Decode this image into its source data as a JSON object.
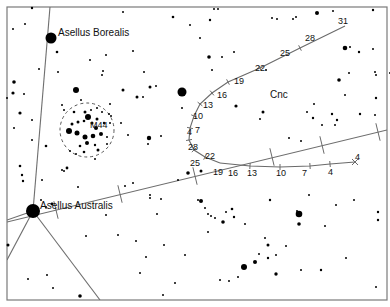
{
  "chart": {
    "frame": {
      "x": 7,
      "y": 7,
      "w": 380,
      "h": 293
    },
    "constellation_label": {
      "text": "Cnc",
      "x": 270,
      "y": 98
    },
    "named_stars": [
      {
        "name": "Asellus Borealis",
        "x": 51,
        "y": 38,
        "r": 5.5,
        "label_x": 58,
        "label_y": 36
      },
      {
        "name": "Asellus Australis",
        "x": 33,
        "y": 211,
        "r": 7,
        "label_x": 40,
        "label_y": 209
      }
    ],
    "cluster": {
      "label": "M44",
      "cx": 87,
      "cy": 130,
      "r": 27,
      "label_x": 90,
      "label_y": 128
    },
    "constellation_lines": [
      [
        [
          50,
          7
        ],
        [
          33,
          211
        ]
      ],
      [
        [
          33,
          211
        ],
        [
          7,
          260
        ]
      ],
      [
        [
          33,
          211
        ],
        [
          100,
          300
        ]
      ],
      [
        [
          33,
          211
        ],
        [
          7,
          220
        ]
      ]
    ],
    "ecliptic": {
      "points": [
        [
          7,
          222
        ],
        [
          387,
          130
        ]
      ],
      "ticks": [
        [
          56,
          210
        ],
        [
          120,
          194
        ],
        [
          195,
          176
        ],
        [
          272,
          157
        ],
        [
          322,
          145
        ],
        [
          378,
          132
        ]
      ]
    },
    "path_upper": {
      "points": [
        [
          345,
          26
        ],
        [
          300,
          48
        ],
        [
          260,
          68
        ],
        [
          228,
          82
        ],
        [
          212,
          93
        ],
        [
          200,
          104
        ],
        [
          194,
          116
        ],
        [
          190,
          128
        ],
        [
          189,
          140
        ],
        [
          194,
          150
        ],
        [
          205,
          157
        ],
        [
          220,
          163
        ]
      ],
      "labels": [
        {
          "t": "31",
          "x": 338,
          "y": 24
        },
        {
          "t": "28",
          "x": 305,
          "y": 41
        },
        {
          "t": "25",
          "x": 280,
          "y": 56
        },
        {
          "t": "22",
          "x": 255,
          "y": 71
        },
        {
          "t": "19",
          "x": 234,
          "y": 84
        },
        {
          "t": "16",
          "x": 217,
          "y": 98
        },
        {
          "t": "13",
          "x": 203,
          "y": 108
        },
        {
          "t": "10",
          "x": 193,
          "y": 119
        },
        {
          "t": "7",
          "x": 195,
          "y": 133
        },
        {
          "t": "4",
          "x": 187,
          "y": 135
        },
        {
          "t": "28",
          "x": 188,
          "y": 150
        },
        {
          "t": "22",
          "x": 205,
          "y": 159
        },
        {
          "t": "25",
          "x": 190,
          "y": 166
        }
      ]
    },
    "path_lower": {
      "points": [
        [
          220,
          163
        ],
        [
          250,
          166
        ],
        [
          280,
          167
        ],
        [
          310,
          166
        ],
        [
          330,
          164
        ],
        [
          355,
          162
        ]
      ],
      "end_marker": {
        "x": 355,
        "y": 162
      },
      "labels": [
        {
          "t": "19",
          "x": 213,
          "y": 175
        },
        {
          "t": "16",
          "x": 228,
          "y": 176
        },
        {
          "t": "13",
          "x": 247,
          "y": 176
        },
        {
          "t": "10",
          "x": 276,
          "y": 176
        },
        {
          "t": "7",
          "x": 302,
          "y": 176
        },
        {
          "t": "4",
          "x": 328,
          "y": 175
        },
        {
          "t": "4",
          "x": 355,
          "y": 160
        }
      ]
    },
    "stars": [
      [
        32,
        8,
        1.2
      ],
      [
        13,
        29,
        1
      ],
      [
        25,
        24,
        1
      ],
      [
        123,
        12,
        1
      ],
      [
        173,
        17,
        1.3
      ],
      [
        190,
        25,
        1
      ],
      [
        210,
        20,
        1.2
      ],
      [
        214,
        9,
        1
      ],
      [
        218,
        9,
        1
      ],
      [
        272,
        18,
        1
      ],
      [
        277,
        19,
        1
      ],
      [
        293,
        19,
        1
      ],
      [
        296,
        17,
        1
      ],
      [
        317,
        13,
        2
      ],
      [
        333,
        11,
        1
      ],
      [
        373,
        10,
        1.2
      ],
      [
        39,
        69,
        1
      ],
      [
        57,
        52,
        1.3
      ],
      [
        90,
        60,
        1
      ],
      [
        106,
        55,
        1
      ],
      [
        133,
        51,
        1
      ],
      [
        103,
        71,
        1
      ],
      [
        58,
        72,
        1
      ],
      [
        102,
        75,
        1
      ],
      [
        144,
        72,
        1
      ],
      [
        150,
        87,
        1.5
      ],
      [
        156,
        86,
        1
      ],
      [
        14,
        82,
        1.8
      ],
      [
        13,
        93,
        1.6
      ],
      [
        24,
        94,
        1
      ],
      [
        7,
        98,
        1
      ],
      [
        20,
        113,
        1.6
      ],
      [
        32,
        120,
        1
      ],
      [
        14,
        128,
        1
      ],
      [
        32,
        140,
        1
      ],
      [
        62,
        105,
        1
      ],
      [
        81,
        100,
        1
      ],
      [
        76,
        90,
        3
      ],
      [
        123,
        90,
        1.5
      ],
      [
        137,
        97,
        1.5
      ],
      [
        143,
        97,
        1
      ],
      [
        182,
        92,
        4.5
      ],
      [
        182,
        108,
        1
      ],
      [
        110,
        104,
        1
      ],
      [
        111,
        116,
        1
      ],
      [
        121,
        123,
        1
      ],
      [
        128,
        135,
        1
      ],
      [
        149,
        138,
        2.2
      ],
      [
        161,
        136,
        1
      ],
      [
        148,
        144,
        1
      ],
      [
        222,
        57,
        1
      ],
      [
        209,
        57,
        1.8
      ],
      [
        200,
        38,
        1
      ],
      [
        234,
        52,
        1
      ],
      [
        266,
        70,
        1
      ],
      [
        212,
        70,
        1
      ],
      [
        236,
        106,
        1.6
      ],
      [
        263,
        112,
        1.5
      ],
      [
        260,
        119,
        1
      ],
      [
        313,
        118,
        1.2
      ],
      [
        322,
        125,
        1
      ],
      [
        337,
        120,
        1.2
      ],
      [
        289,
        138,
        1
      ],
      [
        301,
        141,
        1
      ],
      [
        314,
        104,
        1
      ],
      [
        307,
        112,
        1
      ],
      [
        332,
        114,
        1.2
      ],
      [
        360,
        114,
        1.2
      ],
      [
        375,
        115,
        1
      ],
      [
        376,
        98,
        1.2
      ],
      [
        375,
        72,
        1
      ],
      [
        390,
        73,
        1
      ],
      [
        359,
        52,
        1.2
      ],
      [
        345,
        48,
        2.3
      ],
      [
        350,
        47,
        1
      ],
      [
        373,
        49,
        1
      ],
      [
        376,
        75,
        1
      ],
      [
        349,
        73,
        1
      ],
      [
        339,
        80,
        1.8
      ],
      [
        345,
        95,
        1
      ],
      [
        335,
        125,
        1
      ],
      [
        20,
        166,
        1.3
      ],
      [
        22,
        175,
        1.2
      ],
      [
        46,
        146,
        1.3
      ],
      [
        62,
        170,
        1
      ],
      [
        95,
        159,
        1
      ],
      [
        64,
        171,
        1
      ],
      [
        67,
        168,
        1.4
      ],
      [
        23,
        181,
        1.2
      ],
      [
        42,
        180,
        1
      ],
      [
        46,
        207,
        1
      ],
      [
        52,
        204,
        1.4
      ],
      [
        78,
        187,
        1
      ],
      [
        41,
        200,
        1
      ],
      [
        125,
        186,
        1
      ],
      [
        133,
        183,
        1
      ],
      [
        150,
        195,
        1
      ],
      [
        150,
        198,
        1
      ],
      [
        161,
        199,
        1
      ],
      [
        178,
        180,
        1
      ],
      [
        188,
        173,
        1.8
      ],
      [
        201,
        171,
        1.5
      ],
      [
        157,
        214,
        1
      ],
      [
        106,
        215,
        1
      ],
      [
        198,
        200,
        1
      ],
      [
        208,
        214,
        1
      ],
      [
        215,
        218,
        1
      ],
      [
        211,
        216,
        1
      ],
      [
        226,
        212,
        1
      ],
      [
        118,
        235,
        1
      ],
      [
        136,
        241,
        1
      ],
      [
        146,
        257,
        1
      ],
      [
        140,
        273,
        1
      ],
      [
        185,
        255,
        1
      ],
      [
        86,
        236,
        1
      ],
      [
        28,
        279,
        1
      ],
      [
        47,
        275,
        1
      ],
      [
        53,
        288,
        1
      ],
      [
        80,
        296,
        1.8
      ],
      [
        8,
        245,
        1.5
      ],
      [
        164,
        245,
        1
      ],
      [
        163,
        295,
        1
      ],
      [
        201,
        201,
        2
      ],
      [
        205,
        208,
        1
      ],
      [
        223,
        222,
        1.8
      ],
      [
        234,
        217,
        1.2
      ],
      [
        270,
        200,
        1.2
      ],
      [
        232,
        209,
        1.3
      ],
      [
        208,
        232,
        1
      ],
      [
        245,
        224,
        1
      ],
      [
        265,
        238,
        1
      ],
      [
        268,
        245,
        1.5
      ],
      [
        276,
        255,
        1
      ],
      [
        286,
        246,
        1
      ],
      [
        255,
        262,
        2
      ],
      [
        268,
        258,
        1.2
      ],
      [
        299,
        214,
        3.3
      ],
      [
        297,
        211,
        1
      ],
      [
        299,
        224,
        1.8
      ],
      [
        309,
        195,
        1
      ],
      [
        336,
        205,
        1
      ],
      [
        325,
        226,
        1
      ],
      [
        354,
        200,
        1
      ],
      [
        378,
        212,
        1.2
      ],
      [
        378,
        220,
        1.2
      ],
      [
        238,
        277,
        1
      ],
      [
        229,
        281,
        1
      ],
      [
        244,
        267,
        3
      ],
      [
        276,
        274,
        1.7
      ],
      [
        301,
        270,
        1
      ],
      [
        321,
        270,
        1.2
      ],
      [
        220,
        280,
        1
      ],
      [
        175,
        283,
        1
      ],
      [
        259,
        254,
        1
      ],
      [
        346,
        258,
        1
      ],
      [
        376,
        287,
        1
      ]
    ],
    "cluster_stars": [
      [
        74,
        112,
        1.3
      ],
      [
        64,
        110,
        1
      ],
      [
        85,
        112,
        1.5
      ],
      [
        91,
        110,
        1
      ],
      [
        97,
        108,
        1
      ],
      [
        102,
        112,
        1
      ],
      [
        88,
        117,
        3
      ],
      [
        97,
        119,
        1.5
      ],
      [
        72,
        124,
        1.5
      ],
      [
        78,
        122,
        1.5
      ],
      [
        84,
        121,
        1.3
      ],
      [
        92,
        123,
        1.5
      ],
      [
        96,
        128,
        2
      ],
      [
        104,
        123,
        1.2
      ],
      [
        110,
        123,
        1
      ],
      [
        69,
        131,
        3
      ],
      [
        77,
        133,
        2.5
      ],
      [
        85,
        137,
        2.5
      ],
      [
        93,
        136,
        2.3
      ],
      [
        101,
        134,
        2
      ],
      [
        107,
        137,
        1
      ],
      [
        80,
        146,
        1.3
      ],
      [
        87,
        143,
        2
      ],
      [
        95,
        145,
        1.2
      ],
      [
        98,
        150,
        1.5
      ],
      [
        84,
        152,
        1.3
      ],
      [
        76,
        154,
        1
      ],
      [
        70,
        151,
        1
      ],
      [
        107,
        144,
        1
      ],
      [
        109,
        114,
        1
      ]
    ]
  }
}
